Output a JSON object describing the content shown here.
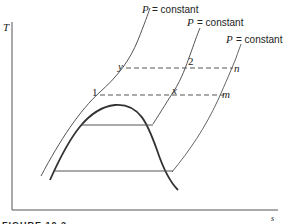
{
  "figure": {
    "caption": "FIGURE 10.2",
    "axes": {
      "y_label": "T",
      "x_label": "s"
    },
    "isobars": [
      {
        "label_p": "P",
        "label_eq": "= constant"
      },
      {
        "label_p": "P",
        "label_eq": "= constant"
      },
      {
        "label_p": "P",
        "label_eq": "= constant"
      }
    ],
    "points": {
      "y": "y",
      "two": "2",
      "n": "n",
      "one": "1",
      "x": "x",
      "m": "m"
    }
  }
}
